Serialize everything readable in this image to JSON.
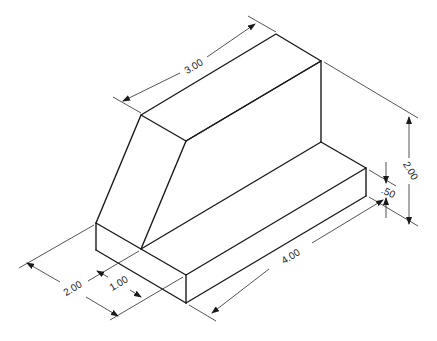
{
  "drawing": {
    "type": "isometric-technical-drawing",
    "units": "inches",
    "colors": {
      "line": "#1a1a1a",
      "background": "#ffffff"
    }
  },
  "dimensions": {
    "top_length": "3.00",
    "overall_height": "2.00",
    "base_height": ".50",
    "overall_length": "4.00",
    "overall_depth": "2.00",
    "upright_depth": "1.00"
  }
}
